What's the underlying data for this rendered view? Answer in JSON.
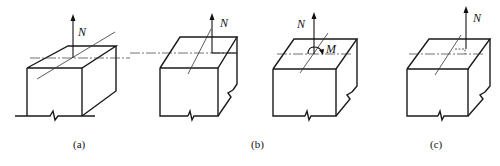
{
  "figure": {
    "panels": [
      {
        "id": "a",
        "caption": "(a)",
        "force_label": "N",
        "moment_label": null,
        "description": "Block under axial force N acting at centroid"
      },
      {
        "id": "b1",
        "caption": "(b)",
        "force_label": "N",
        "moment_label": null,
        "description": "Block under eccentric axial force N"
      },
      {
        "id": "b2",
        "caption": "",
        "force_label": "N",
        "moment_label": "M",
        "description": "Equivalent: axial force N at centroid plus moment M"
      },
      {
        "id": "c",
        "caption": "(c)",
        "force_label": "N",
        "moment_label": null,
        "description": "Block under axial force N with small eccentricity (dashed offset)"
      }
    ]
  }
}
